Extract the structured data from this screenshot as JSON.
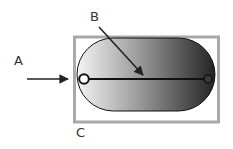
{
  "labels": {
    "a": "A",
    "b": "B",
    "c": "C"
  },
  "colors": {
    "frame": "#a9a9a9",
    "gradient_start": "#f4f4f4",
    "gradient_end": "#222222",
    "stroke": "#111111",
    "label": "#333333"
  }
}
